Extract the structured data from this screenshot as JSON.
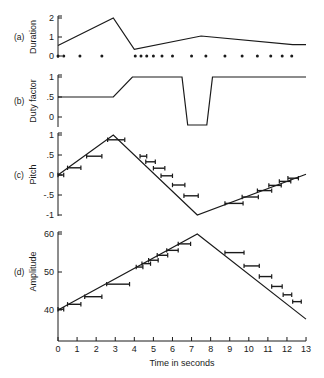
{
  "chart_data": [
    {
      "panel": "(a)",
      "type": "line",
      "ylabel": "Duration",
      "yticks": [
        "0",
        "1",
        "2"
      ],
      "ylim": [
        0,
        2
      ],
      "line": {
        "x": [
          0,
          2.9,
          4.0,
          7.5,
          12.3,
          13
        ],
        "y": [
          0.55,
          2.0,
          0.35,
          1.05,
          0.6,
          0.6
        ]
      },
      "event_dots": [
        0,
        0.3,
        1.15,
        2.3,
        4.05,
        4.35,
        4.65,
        5.0,
        5.45,
        6.0,
        7.0,
        7.75,
        8.75,
        9.65,
        10.45,
        11.15,
        11.75,
        12.25
      ]
    },
    {
      "panel": "(b)",
      "type": "line",
      "ylabel": "Duty factor",
      "yticks": [
        "0",
        ".5",
        "1"
      ],
      "ylim": [
        0,
        1
      ],
      "line": {
        "x": [
          0,
          2.9,
          3.9,
          6.5,
          6.8,
          7.8,
          8.1,
          13
        ],
        "y": [
          0.5,
          0.5,
          1.0,
          1.0,
          -0.2,
          -0.2,
          1.0,
          1.0
        ]
      }
    },
    {
      "panel": "(c)",
      "type": "line",
      "ylabel": "Pitch",
      "yticks": [
        "-1",
        "-.5",
        "0",
        ".5",
        "1"
      ],
      "ylim": [
        -1,
        1
      ],
      "line": {
        "x": [
          0,
          2.9,
          7.3,
          13
        ],
        "y": [
          0,
          1,
          -1,
          0.02
        ]
      },
      "bars": [
        {
          "t": 0.0,
          "w": 0.3,
          "v": 0.0
        },
        {
          "t": 0.5,
          "w": 0.7,
          "v": 0.18
        },
        {
          "t": 1.5,
          "w": 0.8,
          "v": 0.47
        },
        {
          "t": 2.6,
          "w": 0.9,
          "v": 0.88
        },
        {
          "t": 4.3,
          "w": 0.35,
          "v": 0.47
        },
        {
          "t": 4.6,
          "w": 0.5,
          "v": 0.33
        },
        {
          "t": 5.0,
          "w": 0.6,
          "v": 0.17
        },
        {
          "t": 5.4,
          "w": 0.6,
          "v": -0.02
        },
        {
          "t": 6.0,
          "w": 0.65,
          "v": -0.25
        },
        {
          "t": 6.6,
          "w": 0.75,
          "v": -0.52
        },
        {
          "t": 8.75,
          "w": 0.95,
          "v": -0.71
        },
        {
          "t": 9.65,
          "w": 0.85,
          "v": -0.55
        },
        {
          "t": 10.45,
          "w": 0.75,
          "v": -0.39
        },
        {
          "t": 11.05,
          "w": 0.65,
          "v": -0.26
        },
        {
          "t": 11.6,
          "w": 0.6,
          "v": -0.16
        },
        {
          "t": 12.05,
          "w": 0.55,
          "v": -0.08
        }
      ]
    },
    {
      "panel": "(d)",
      "type": "line",
      "ylabel": "Amplitude",
      "xlabel": "Time in seconds",
      "yticks": [
        "40",
        "50",
        "60"
      ],
      "ylim": [
        40,
        60
      ],
      "xticks": [
        "0",
        "1",
        "2",
        "3",
        "4",
        "5",
        "6",
        "7",
        "8",
        "9",
        "10",
        "11",
        "12",
        "13"
      ],
      "xlim": [
        0,
        13
      ],
      "line": {
        "x": [
          0,
          7.3,
          13
        ],
        "y": [
          40,
          60,
          37.6
        ]
      },
      "bars": [
        {
          "t": 0.0,
          "w": 0.3,
          "v": 40.2
        },
        {
          "t": 0.5,
          "w": 0.7,
          "v": 41.5
        },
        {
          "t": 1.4,
          "w": 0.9,
          "v": 43.5
        },
        {
          "t": 2.55,
          "w": 1.2,
          "v": 46.8
        },
        {
          "t": 4.1,
          "w": 0.35,
          "v": 51.3
        },
        {
          "t": 4.4,
          "w": 0.45,
          "v": 52.2
        },
        {
          "t": 4.75,
          "w": 0.5,
          "v": 53.1
        },
        {
          "t": 5.2,
          "w": 0.55,
          "v": 54.4
        },
        {
          "t": 5.7,
          "w": 0.6,
          "v": 55.7
        },
        {
          "t": 6.3,
          "w": 0.65,
          "v": 57.4
        },
        {
          "t": 8.75,
          "w": 1.0,
          "v": 55.1
        },
        {
          "t": 9.75,
          "w": 0.8,
          "v": 51.6
        },
        {
          "t": 10.55,
          "w": 0.65,
          "v": 48.8
        },
        {
          "t": 11.2,
          "w": 0.55,
          "v": 46.2
        },
        {
          "t": 11.8,
          "w": 0.45,
          "v": 44.0
        },
        {
          "t": 12.3,
          "w": 0.45,
          "v": 42.2
        }
      ]
    }
  ]
}
